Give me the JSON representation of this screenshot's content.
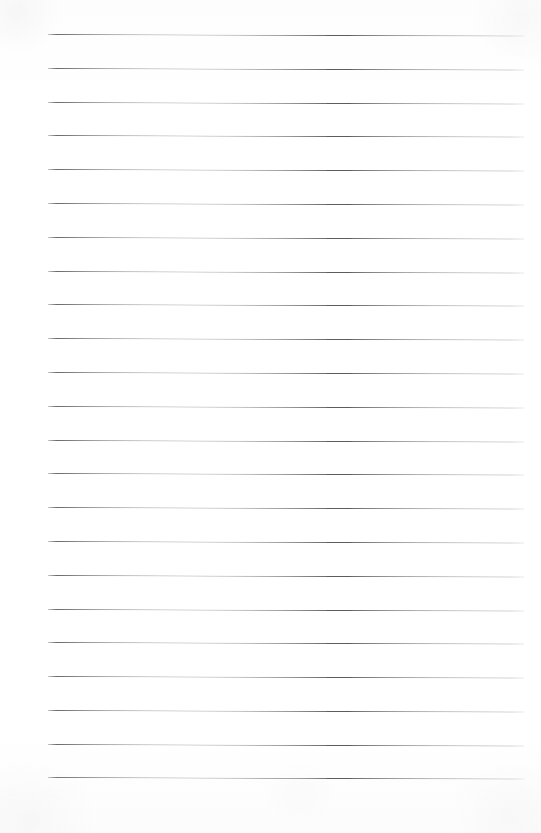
{
  "document": {
    "kind": "scanned-blank-lined-page",
    "page_label": "",
    "body_text": "",
    "width_px": 541,
    "height_px": 833,
    "background_color": "#fefefe",
    "rule_color": "#5c5c5e"
  },
  "ruling": {
    "line_count": 23,
    "first_line_y": 34,
    "line_spacing_px": 33.8,
    "line_left_x": 48,
    "line_right_x": 524,
    "line_thickness_px": 1,
    "slant_deg": 0.18,
    "margin_line_present": false,
    "lines": [
      {
        "index": 1,
        "y": 34,
        "x1": 48,
        "x2": 524
      },
      {
        "index": 2,
        "y": 68,
        "x1": 48,
        "x2": 524
      },
      {
        "index": 3,
        "y": 102,
        "x1": 48,
        "x2": 524
      },
      {
        "index": 4,
        "y": 135,
        "x1": 48,
        "x2": 524
      },
      {
        "index": 5,
        "y": 169,
        "x1": 48,
        "x2": 524
      },
      {
        "index": 6,
        "y": 203,
        "x1": 48,
        "x2": 524
      },
      {
        "index": 7,
        "y": 237,
        "x1": 48,
        "x2": 524
      },
      {
        "index": 8,
        "y": 271,
        "x1": 48,
        "x2": 524
      },
      {
        "index": 9,
        "y": 304,
        "x1": 48,
        "x2": 524
      },
      {
        "index": 10,
        "y": 338,
        "x1": 48,
        "x2": 524
      },
      {
        "index": 11,
        "y": 372,
        "x1": 48,
        "x2": 524
      },
      {
        "index": 12,
        "y": 406,
        "x1": 48,
        "x2": 524
      },
      {
        "index": 13,
        "y": 440,
        "x1": 48,
        "x2": 524
      },
      {
        "index": 14,
        "y": 473,
        "x1": 48,
        "x2": 524
      },
      {
        "index": 15,
        "y": 507,
        "x1": 48,
        "x2": 524
      },
      {
        "index": 16,
        "y": 541,
        "x1": 48,
        "x2": 524
      },
      {
        "index": 17,
        "y": 575,
        "x1": 48,
        "x2": 524
      },
      {
        "index": 18,
        "y": 609,
        "x1": 48,
        "x2": 524
      },
      {
        "index": 19,
        "y": 642,
        "x1": 48,
        "x2": 524
      },
      {
        "index": 20,
        "y": 676,
        "x1": 48,
        "x2": 524
      },
      {
        "index": 21,
        "y": 710,
        "x1": 48,
        "x2": 524
      },
      {
        "index": 22,
        "y": 744,
        "x1": 48,
        "x2": 524
      },
      {
        "index": 23,
        "y": 777,
        "x1": 48,
        "x2": 524
      }
    ]
  }
}
